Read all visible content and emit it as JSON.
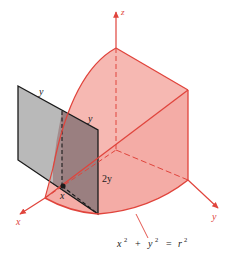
{
  "figure": {
    "type": "3d-solid-diagram",
    "labels": {
      "z_axis": "z",
      "x_axis": "x",
      "y_axis": "y",
      "square_top_edge": "y",
      "square_inner_edge": "y",
      "height": "2y",
      "point_x": "x",
      "equation_base": "x",
      "equation_plus": "+",
      "equation_y": "y",
      "equation_eq": "=",
      "equation_r": "r",
      "exp": "2"
    },
    "colors": {
      "solid_fill": "#f6b8b2",
      "solid_edge": "#e0443c",
      "square_fill": "#b9b9b9",
      "square_overlap_fill": "#9a7f80",
      "square_edge": "#1a1a1a",
      "axis": "#e0443c",
      "background": "#ffffff"
    }
  }
}
